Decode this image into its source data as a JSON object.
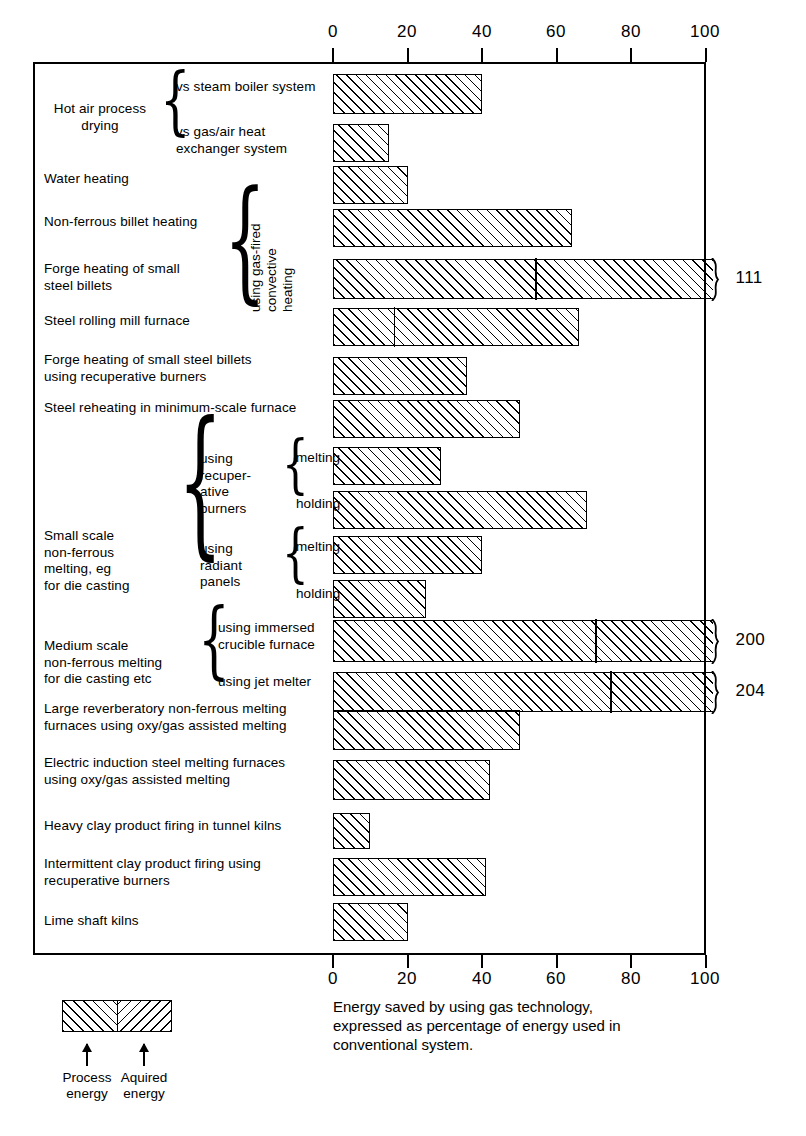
{
  "chart_data": {
    "type": "bar",
    "orientation": "horizontal",
    "title": "",
    "xlabel": "Energy saved by using gas technology, expressed as percentage of energy used in conventional system.",
    "ylabel": "",
    "xlim": [
      0,
      100
    ],
    "xticks": [
      0,
      20,
      40,
      60,
      80,
      100
    ],
    "grid": false,
    "axis_top_labels": [
      "0",
      "20",
      "40",
      "60",
      "80",
      "100"
    ],
    "axis_bottom_labels": [
      "0",
      "20",
      "40",
      "60",
      "80",
      "100"
    ],
    "note": "Bars split into Process energy (left segment) and Aquired energy (right segment); three bars exceed the 100 axis and are labelled with their true value.",
    "categories": [
      "Hot air process drying vs steam boiler system",
      "Hot air process drying vs gas/air heat exchanger system",
      "Water heating",
      "Non-ferrous billet heating",
      "Forge heating of small steel billets",
      "Steel rolling mill furnace",
      "Forge heating of small steel billets using recuperative burners",
      "Steel reheating in minimum-scale furnace",
      "Small scale non-ferrous melting using recuperative burners - melting",
      "Small scale non-ferrous melting using recuperative burners - holding",
      "Small scale non-ferrous melting using radiant panels - melting",
      "Small scale non-ferrous melting using radiant panels - holding",
      "Medium scale non-ferrous melting using immersed crucible furnace",
      "Medium scale non-ferrous melting using jet melter",
      "Large reverberatory non-ferrous melting furnaces using oxy/gas assisted melting",
      "Electric induction steel melting furnaces using oxy/gas assisted melting",
      "Heavy clay product firing in tunnel kilns",
      "Intermittent clay product firing using recuperative burners",
      "Lime shaft kilns"
    ],
    "values": [
      40,
      15,
      20,
      64,
      111,
      66,
      36,
      50,
      29,
      68,
      40,
      25,
      200,
      204,
      50,
      42,
      10,
      41,
      20
    ],
    "split_at": [
      null,
      null,
      null,
      null,
      54,
      16,
      null,
      null,
      null,
      null,
      null,
      null,
      70,
      74,
      null,
      null,
      null,
      null,
      null
    ],
    "overflow_labels": [
      null,
      null,
      null,
      null,
      "111",
      null,
      null,
      null,
      null,
      null,
      null,
      null,
      "200",
      "204",
      null,
      null,
      null,
      null,
      null
    ]
  },
  "bars": [
    {
      "value": 40,
      "split": null,
      "over": false,
      "label": ""
    },
    {
      "value": 15,
      "split": null,
      "over": false,
      "label": ""
    },
    {
      "value": 20,
      "split": null,
      "over": false,
      "label": ""
    },
    {
      "value": 64,
      "split": null,
      "over": false,
      "label": ""
    },
    {
      "value": 111,
      "split": 54,
      "over": true,
      "label": "111"
    },
    {
      "value": 66,
      "split": 16,
      "over": false,
      "label": ""
    },
    {
      "value": 36,
      "split": null,
      "over": false,
      "label": ""
    },
    {
      "value": 50,
      "split": null,
      "over": false,
      "label": ""
    },
    {
      "value": 29,
      "split": null,
      "over": false,
      "label": ""
    },
    {
      "value": 68,
      "split": null,
      "over": false,
      "label": ""
    },
    {
      "value": 40,
      "split": null,
      "over": false,
      "label": ""
    },
    {
      "value": 25,
      "split": null,
      "over": false,
      "label": ""
    },
    {
      "value": 200,
      "split": 70,
      "over": true,
      "label": "200"
    },
    {
      "value": 204,
      "split": 74,
      "over": true,
      "label": "204"
    },
    {
      "value": 50,
      "split": null,
      "over": false,
      "label": ""
    },
    {
      "value": 42,
      "split": null,
      "over": false,
      "label": ""
    },
    {
      "value": 10,
      "split": null,
      "over": false,
      "label": ""
    },
    {
      "value": 41,
      "split": null,
      "over": false,
      "label": ""
    },
    {
      "value": 20,
      "split": null,
      "over": false,
      "label": ""
    }
  ],
  "labels": {
    "hot_air": "Hot air process\ndrying",
    "hot_air_sub1": "vs steam boiler system",
    "hot_air_sub2": "vs gas/air heat\nexchanger system",
    "water_heating": "Water heating",
    "non_ferrous_billet": "Non-ferrous billet heating",
    "forge_small_billets": "Forge heating of small\nsteel billets",
    "steel_rolling": "Steel rolling mill furnace",
    "gas_fired_convective": "using gas-fired\nconvective\nheating",
    "forge_recuperative": "Forge heating of small steel billets\nusing recuperative burners",
    "steel_reheating": "Steel reheating in minimum-scale furnace",
    "small_scale": "Small scale\nnon-ferrous\nmelting, eg\nfor die casting",
    "using_recuperative_burners": "using\nrecuper-\native\nburners",
    "using_radiant_panels": "using\nradiant\npanels",
    "melting_1": "melting",
    "holding_1": "holding",
    "melting_2": "melting",
    "holding_2": "holding",
    "medium_scale": "Medium scale\nnon-ferrous melting\nfor die casting etc",
    "immersed_crucible": "using immersed\ncrucible furnace",
    "jet_melter": "using jet melter",
    "large_reverberatory": "Large reverberatory non-ferrous melting\nfurnaces using oxy/gas assisted melting",
    "electric_induction": "Electric induction steel melting furnaces\nusing oxy/gas assisted melting",
    "heavy_clay": "Heavy clay product firing in tunnel kilns",
    "intermittent_clay": "Intermittent clay product firing using\nrecuperative burners",
    "lime_shaft": "Lime shaft kilns"
  },
  "legend": {
    "process": "Process\nenergy",
    "aquired": "Aquired\nenergy"
  },
  "caption": "Energy saved by using gas technology,\nexpressed as percentage of energy used in\nconventional system."
}
